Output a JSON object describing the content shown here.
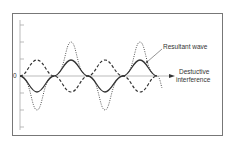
{
  "diagram": {
    "axis": {
      "zero_label": "0"
    },
    "labels": {
      "resultant": "Resultant wave",
      "destructive_line1": "Destuctive",
      "destructive_line2": "interference"
    },
    "waves": [
      {
        "name": "wave-a",
        "style": "solid",
        "amplitude": 16,
        "phase": "down-first"
      },
      {
        "name": "wave-b",
        "style": "dashed",
        "amplitude": 16,
        "phase": "up-first"
      },
      {
        "name": "wave-c",
        "style": "dotted",
        "amplitude": 34,
        "phase": "down-first"
      }
    ],
    "colors": {
      "frame": "#777777",
      "line": "#333333",
      "axis": "#aaaaaa"
    }
  }
}
